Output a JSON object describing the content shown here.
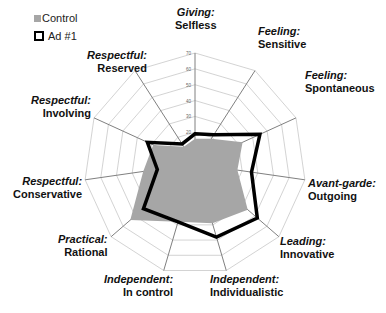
{
  "chart_data": {
    "type": "radar",
    "title": "",
    "legend": {
      "position": "top-left",
      "entries": [
        {
          "name": "Control",
          "style": "filled",
          "color": "#a6a6a6"
        },
        {
          "name": "Ad #1",
          "style": "outline",
          "color": "#000000"
        }
      ]
    },
    "axes": [
      {
        "category": "Giving:",
        "label": "Selfless"
      },
      {
        "category": "Feeling:",
        "label": "Sensitive"
      },
      {
        "category": "Feeling:",
        "label": "Spontaneous"
      },
      {
        "category": "Avant-garde:",
        "label": "Outgoing"
      },
      {
        "category": "Leading:",
        "label": "Innovative"
      },
      {
        "category": "Independent:",
        "label": "Individualistic"
      },
      {
        "category": "Independent:",
        "label": "In control"
      },
      {
        "category": "Practical:",
        "label": "Rational"
      },
      {
        "category": "Respectful:",
        "label": "Conservative"
      },
      {
        "category": "Respectful:",
        "label": "Involving"
      },
      {
        "category": "Respectful:",
        "label": "Reserved"
      }
    ],
    "range": [
      0,
      70
    ],
    "ticks": [
      0,
      10,
      20,
      30,
      40,
      50,
      60,
      70
    ],
    "tick_labels": [
      "0",
      "10",
      "20",
      "30",
      "40",
      "50",
      "60",
      "70"
    ],
    "grid": true,
    "series": [
      {
        "name": "Control",
        "values": [
          16,
          19,
          33,
          27,
          44,
          39,
          38,
          54,
          33,
          29,
          13
        ]
      },
      {
        "name": "Ad #1",
        "values": [
          19,
          22,
          45,
          36,
          52,
          48,
          38,
          43,
          24,
          33,
          15
        ]
      }
    ]
  },
  "colors": {
    "control_fill": "#a6a6a6",
    "ad_line": "#000000",
    "grid": "#c8c8c8",
    "axis": "#808080"
  }
}
